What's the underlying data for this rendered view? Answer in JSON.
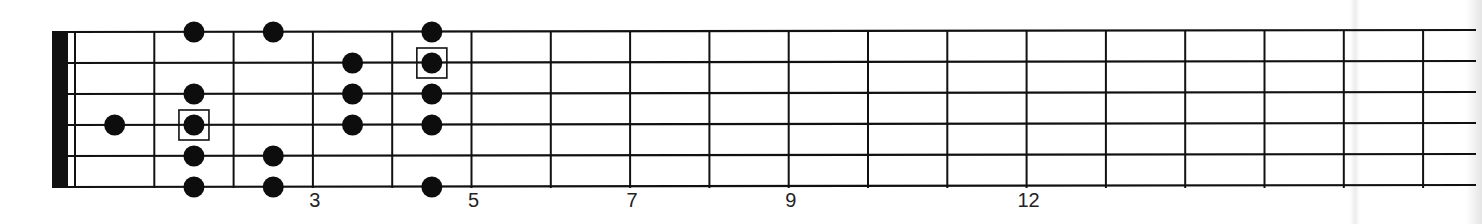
{
  "diagram": {
    "type": "guitar-fretboard-scale-pattern",
    "strings": 6,
    "frets_shown": 17,
    "fret_markers": [
      {
        "label": "3",
        "wire": 3
      },
      {
        "label": "5",
        "wire": 5
      },
      {
        "label": "7",
        "wire": 7
      },
      {
        "label": "9",
        "wire": 9
      },
      {
        "label": "12",
        "wire": 12
      }
    ],
    "notes": [
      {
        "string": 1,
        "fret": 2,
        "root": false
      },
      {
        "string": 1,
        "fret": 3,
        "root": false
      },
      {
        "string": 1,
        "fret": 5,
        "root": false
      },
      {
        "string": 2,
        "fret": 4,
        "root": false
      },
      {
        "string": 2,
        "fret": 5,
        "root": true
      },
      {
        "string": 3,
        "fret": 2,
        "root": false
      },
      {
        "string": 3,
        "fret": 4,
        "root": false
      },
      {
        "string": 3,
        "fret": 5,
        "root": false
      },
      {
        "string": 4,
        "fret": 1,
        "root": false
      },
      {
        "string": 4,
        "fret": 2,
        "root": true
      },
      {
        "string": 4,
        "fret": 4,
        "root": false
      },
      {
        "string": 4,
        "fret": 5,
        "root": false
      },
      {
        "string": 5,
        "fret": 2,
        "root": false
      },
      {
        "string": 5,
        "fret": 3,
        "root": false
      },
      {
        "string": 6,
        "fret": 2,
        "root": false
      },
      {
        "string": 6,
        "fret": 3,
        "root": false
      },
      {
        "string": 6,
        "fret": 5,
        "root": false
      }
    ],
    "colors": {
      "line": "#111111",
      "dot": "#0d0d0d",
      "nut": "#111111",
      "background": "#ffffff"
    }
  }
}
